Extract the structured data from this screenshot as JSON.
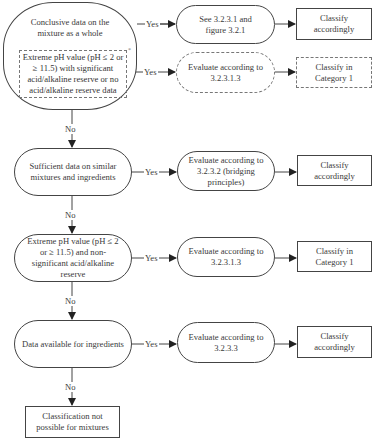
{
  "diagram": {
    "type": "flowchart",
    "labels": {
      "yes": "Yes",
      "no": "No"
    },
    "decisions": [
      {
        "id": "d1",
        "text_main": "Conclusive data on the mixture as a whole",
        "text_sub": "Extreme pH value (pH ≤ 2 or ≥ 11.5) with significant acid/alkaline reserve or no acid/alkaline reserve data",
        "sub_mark": "*"
      },
      {
        "id": "d2",
        "text": "Sufficient data on similar mixtures and ingredients"
      },
      {
        "id": "d3",
        "text": "Extreme pH value (pH ≤ 2 or ≥ 11.5) and non-significant acid/alkaline reserve"
      },
      {
        "id": "d4",
        "text": "Data available for ingredients"
      }
    ],
    "actions": [
      {
        "id": "a1",
        "text": "See 3.2.3.1 and figure 3.2.1",
        "style": "solid"
      },
      {
        "id": "a1b",
        "text": "Evaluate according to 3.2.3.1.3",
        "style": "dashed"
      },
      {
        "id": "a2",
        "text": "Evaluate according to 3.2.3.2 (bridging principles)",
        "style": "solid"
      },
      {
        "id": "a3",
        "text": "Evaluate according to 3.2.3.1.3",
        "style": "solid"
      },
      {
        "id": "a4",
        "text": "Evaluate according to 3.2.3.3",
        "style": "solid"
      }
    ],
    "outcomes": [
      {
        "id": "o1",
        "text": "Classify accordingly",
        "style": "solid"
      },
      {
        "id": "o1b",
        "text": "Classify in Category 1",
        "style": "dashed"
      },
      {
        "id": "o2",
        "text": "Classify accordingly",
        "style": "solid"
      },
      {
        "id": "o3",
        "text": "Classify in Category 1",
        "style": "solid"
      },
      {
        "id": "o4",
        "text": "Classify accordingly",
        "style": "solid"
      },
      {
        "id": "o5",
        "text": "Classification not possible for mixtures",
        "style": "solid"
      }
    ],
    "edges": [
      {
        "from": "d1",
        "to": "a1",
        "label": "Yes"
      },
      {
        "from": "d1-sub",
        "to": "a1b",
        "label": "Yes"
      },
      {
        "from": "a1",
        "to": "o1"
      },
      {
        "from": "a1b",
        "to": "o1b"
      },
      {
        "from": "d1",
        "to": "d2",
        "label": "No"
      },
      {
        "from": "d2",
        "to": "a2",
        "label": "Yes"
      },
      {
        "from": "a2",
        "to": "o2"
      },
      {
        "from": "d2",
        "to": "d3",
        "label": "No"
      },
      {
        "from": "d3",
        "to": "a3",
        "label": "Yes"
      },
      {
        "from": "a3",
        "to": "o3"
      },
      {
        "from": "d3",
        "to": "d4",
        "label": "No"
      },
      {
        "from": "d4",
        "to": "a4",
        "label": "Yes"
      },
      {
        "from": "a4",
        "to": "o4"
      },
      {
        "from": "d4",
        "to": "o5",
        "label": "No"
      }
    ],
    "colors": {
      "line": "#444444",
      "dashed_line": "#777777",
      "text": "#3a3a3a",
      "background": "#ffffff"
    }
  }
}
